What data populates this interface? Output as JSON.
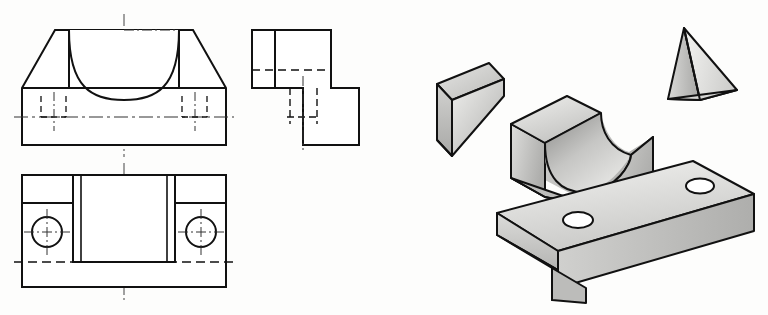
{
  "sheet": {
    "title": "Orthographic and exploded isometric views of a V-block saddle bracket",
    "background_color": "#fdfdfc",
    "line_color": "#111111",
    "width": 768,
    "height": 315
  },
  "styles": {
    "visible_edge": {
      "color": "#111111",
      "width": 2.0
    },
    "thin_edge": {
      "color": "#111111",
      "width": 1.3
    },
    "hidden_edge": {
      "color": "#111111",
      "width": 1.3,
      "dash": "7,4"
    },
    "center_line": {
      "color": "#444444",
      "width": 1.0,
      "dash": "12,3,2,3"
    },
    "shade_light": "#f2f2f0",
    "shade_mid": "#d7d7d5",
    "shade_dark": "#a9a9a7",
    "shade_darkest": "#8d8d8b"
  },
  "views": {
    "front": {
      "name": "front-view",
      "label": "Front view",
      "outline": [
        [
          22,
          145
        ],
        [
          22,
          88
        ],
        [
          55,
          30
        ],
        [
          193,
          30
        ],
        [
          226,
          88
        ],
        [
          226,
          145
        ]
      ],
      "vertical_edges": [
        {
          "x": 69,
          "y1": 30,
          "y2": 88
        },
        {
          "x": 179,
          "y1": 30,
          "y2": 88
        }
      ],
      "waist_line": {
        "x1": 22,
        "y1": 88,
        "x2": 226,
        "y2": 88
      },
      "saddle_arc": {
        "start": [
          69,
          30
        ],
        "end": [
          179,
          30
        ],
        "rx": 55,
        "ry": 52,
        "description": "concave semicircular V-groove opening upward"
      },
      "vertical_center_line": {
        "x": 124,
        "y1": 14,
        "y2": 300
      },
      "horizontal_center_line": {
        "x1": 14,
        "y1": 117,
        "x2": 234,
        "y2": 117
      },
      "hidden_hole_left": {
        "x1": 41,
        "x2": 66,
        "y_top": 96,
        "y_bottom": 117
      },
      "hidden_hole_right": {
        "x1": 182,
        "x2": 207,
        "y_top": 96,
        "y_bottom": 117
      },
      "hole_center_left": {
        "x": 54,
        "y1": 92,
        "y2": 130
      },
      "hole_center_right": {
        "x": 195,
        "y1": 92,
        "y2": 130
      }
    },
    "top": {
      "name": "top-view",
      "label": "Top view",
      "outline": [
        [
          22,
          175
        ],
        [
          226,
          175
        ],
        [
          226,
          287
        ],
        [
          22,
          287
        ]
      ],
      "inner_block": {
        "x1": 73,
        "y1": 175,
        "x2": 175,
        "y2": 262
      },
      "inner_block_inner_left": {
        "x": 81,
        "y1": 175,
        "y2": 262
      },
      "inner_block_inner_right": {
        "x": 167,
        "y1": 175,
        "y2": 262
      },
      "shelf_line_left": {
        "x1": 22,
        "y1": 203,
        "x2": 73,
        "y2": 203
      },
      "shelf_line_right": {
        "x1": 175,
        "y1": 203,
        "x2": 226,
        "y2": 203
      },
      "hidden_base_line": {
        "x1": 14,
        "y1": 262,
        "x2": 234,
        "y2": 262
      },
      "hole_left": {
        "cx": 47,
        "cy": 232,
        "r": 15
      },
      "hole_right": {
        "cx": 201,
        "cy": 232,
        "r": 15
      },
      "hole_cross_extent": 23
    },
    "side": {
      "name": "side-view",
      "label": "Right side view",
      "outline": [
        [
          252,
          30
        ],
        [
          331,
          30
        ],
        [
          331,
          88
        ],
        [
          359,
          88
        ],
        [
          359,
          145
        ],
        [
          303,
          145
        ],
        [
          303,
          88
        ],
        [
          252,
          88
        ]
      ],
      "upright_edge": {
        "x": 275,
        "y1": 30,
        "y2": 88
      },
      "top_hidden_line": {
        "x1": 252,
        "y1": 70,
        "x2": 331,
        "y2": 70
      },
      "hidden_vertical_left": {
        "x": 290,
        "y1": 88,
        "y2": 124
      },
      "hidden_vertical_right": {
        "x": 317,
        "y1": 88,
        "y2": 124
      },
      "hidden_horizontal": {
        "x1": 252,
        "y1": 117,
        "x2": 331,
        "y2": 117
      },
      "center_line": {
        "x": 303,
        "y1": 76,
        "y2": 150
      }
    }
  },
  "isometric": {
    "left_wedge": {
      "name": "left-wedge",
      "label": "Left triangular wedge",
      "top_face": [
        [
          437,
          84
        ],
        [
          489,
          63
        ],
        [
          504,
          79
        ],
        [
          452,
          100
        ]
      ],
      "front_face": [
        [
          437,
          84
        ],
        [
          452,
          100
        ],
        [
          452,
          155
        ],
        [
          437,
          139
        ]
      ],
      "slope_face": [
        [
          452,
          100
        ],
        [
          504,
          79
        ],
        [
          504,
          96
        ],
        [
          452,
          155
        ]
      ],
      "shading": {
        "top": "#d4d4d2",
        "front": "#bdbdbb",
        "slope": "#c8c8c6"
      }
    },
    "saddle_block": {
      "name": "saddle-block",
      "label": "V-block saddle with concave cylindrical groove",
      "outer_top_left": [
        [
          511,
          124
        ],
        [
          567,
          96
        ],
        [
          600,
          114
        ],
        [
          545,
          144
        ]
      ],
      "left_wall_front": [
        [
          511,
          124
        ],
        [
          545,
          144
        ],
        [
          545,
          196
        ],
        [
          511,
          177
        ]
      ],
      "right_wall": [
        [
          600,
          114
        ],
        [
          653,
          136
        ],
        [
          653,
          176
        ],
        [
          600,
          156
        ]
      ],
      "groove_description": "concave cylindrical trough sweeping between the two upright walls",
      "shading": {
        "top": "#dcdcda",
        "left": "#c4c4c2",
        "groove": "#bcbcba",
        "right": "#cfcfcd"
      }
    },
    "right_wedge": {
      "name": "right-wedge",
      "label": "Right triangular wedge",
      "apex": [
        684,
        28
      ],
      "base_left": [
        668,
        99
      ],
      "base_right": [
        737,
        90
      ],
      "back_edge": [
        [
          684,
          28
        ],
        [
          700,
          100
        ]
      ],
      "shading": {
        "left": "#c2c2c0",
        "right": "#e4e4e2"
      }
    },
    "base_plate": {
      "name": "base-plate",
      "label": "Rectangular base plate with two through holes and a front notch",
      "top_face": [
        [
          497,
          213
        ],
        [
          693,
          161
        ],
        [
          754,
          194
        ],
        [
          558,
          251
        ]
      ],
      "front_face": [
        [
          497,
          213
        ],
        [
          558,
          251
        ],
        [
          558,
          288
        ],
        [
          497,
          249
        ]
      ],
      "right_face": [
        [
          754,
          194
        ],
        [
          754,
          231
        ],
        [
          558,
          288
        ],
        [
          558,
          251
        ]
      ],
      "notch": {
        "x1": 552,
        "y1": 268,
        "x2": 586,
        "y2": 300
      },
      "hole_near": {
        "cx": 578,
        "cy": 220,
        "rx": 15,
        "ry": 8
      },
      "hole_far": {
        "cx": 700,
        "cy": 186,
        "rx": 14,
        "ry": 7.5
      },
      "shading": {
        "top": "#dedede",
        "front": "#c9c9c7",
        "right": "#bfbfbd"
      }
    }
  }
}
